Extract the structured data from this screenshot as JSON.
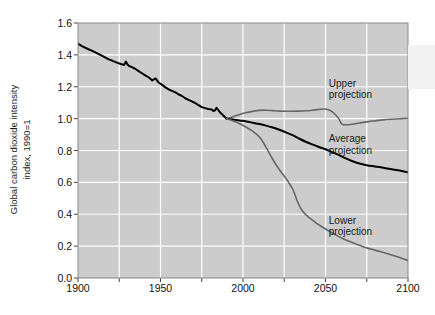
{
  "chart_data": {
    "type": "line",
    "title": "",
    "subtitle": "",
    "xlabel": "",
    "ylabel": "Global carbon dioxide intensity index, 1990=1",
    "ylabel_line1": "Global carbon dioxide intensity",
    "ylabel_line2": "index, 1990=1",
    "xlim": [
      1900,
      2100
    ],
    "ylim": [
      0.0,
      1.6
    ],
    "grid": true,
    "grid_color": "#ffffff",
    "plot_background": "#cccccc",
    "legend_position": "inline-annotations",
    "xticks": [
      1900,
      1950,
      2000,
      2050,
      2100
    ],
    "xtick_labels": [
      "1900",
      "1950",
      "2000",
      "2050",
      "2100"
    ],
    "xminor_ticks": [
      1925,
      1975,
      2025,
      2075
    ],
    "yticks": [
      0.0,
      0.2,
      0.4,
      0.6,
      0.8,
      1.0,
      1.2,
      1.4,
      1.6
    ],
    "ytick_labels": [
      "0.0",
      "0.2",
      "0.4",
      "0.6",
      "0.8",
      "1.0",
      "1.2",
      "1.4",
      "1.6"
    ],
    "annotations": [
      {
        "name": "upper-projection-label",
        "line1": "Upper",
        "line2": "projection",
        "x": 2052,
        "y": 1.22
      },
      {
        "name": "average-projection-label",
        "line1": "Average",
        "line2": "projection",
        "x": 2052,
        "y": 0.87
      },
      {
        "name": "lower-projection-label",
        "line1": "Lower",
        "line2": "projection",
        "x": 2052,
        "y": 0.36
      }
    ],
    "series": [
      {
        "name": "Historical",
        "color": "#000000",
        "width": 2.0,
        "x": [
          1900,
          1903,
          1906,
          1909,
          1912,
          1915,
          1918,
          1921,
          1924,
          1926,
          1928,
          1929,
          1930,
          1931,
          1933,
          1935,
          1937,
          1939,
          1941,
          1943,
          1945,
          1947,
          1949,
          1951,
          1953,
          1955,
          1957,
          1959,
          1961,
          1963,
          1965,
          1967,
          1969,
          1971,
          1973,
          1975,
          1977,
          1979,
          1981,
          1982,
          1983,
          1984,
          1985,
          1986,
          1987,
          1988,
          1989,
          1990
        ],
        "values": [
          1.47,
          1.452,
          1.437,
          1.423,
          1.408,
          1.392,
          1.375,
          1.362,
          1.35,
          1.343,
          1.337,
          1.358,
          1.34,
          1.33,
          1.322,
          1.31,
          1.296,
          1.283,
          1.27,
          1.258,
          1.24,
          1.252,
          1.225,
          1.212,
          1.196,
          1.183,
          1.174,
          1.165,
          1.152,
          1.142,
          1.128,
          1.118,
          1.108,
          1.098,
          1.085,
          1.072,
          1.066,
          1.06,
          1.058,
          1.048,
          1.052,
          1.068,
          1.054,
          1.04,
          1.03,
          1.02,
          1.01,
          1.0
        ]
      },
      {
        "name": "Upper projection",
        "color": "#666666",
        "width": 1.6,
        "x": [
          1990,
          1994,
          1998,
          2002,
          2006,
          2010,
          2014,
          2018,
          2022,
          2026,
          2030,
          2034,
          2038,
          2042,
          2046,
          2050,
          2054,
          2058,
          2060,
          2064,
          2068,
          2072,
          2076,
          2080,
          2085,
          2090,
          2095,
          2100
        ],
        "values": [
          1.0,
          1.012,
          1.026,
          1.038,
          1.046,
          1.052,
          1.053,
          1.05,
          1.047,
          1.046,
          1.046,
          1.047,
          1.049,
          1.053,
          1.058,
          1.06,
          1.044,
          1.0,
          0.965,
          0.962,
          0.968,
          0.975,
          0.981,
          0.986,
          0.992,
          0.996,
          0.999,
          1.002
        ]
      },
      {
        "name": "Average projection",
        "color": "#000000",
        "width": 2.0,
        "x": [
          1990,
          1994,
          1998,
          2002,
          2006,
          2010,
          2014,
          2018,
          2022,
          2026,
          2030,
          2034,
          2038,
          2042,
          2046,
          2050,
          2054,
          2058,
          2062,
          2066,
          2070,
          2075,
          2080,
          2085,
          2090,
          2095,
          2100
        ],
        "values": [
          1.0,
          0.994,
          0.988,
          0.982,
          0.974,
          0.966,
          0.956,
          0.944,
          0.93,
          0.914,
          0.896,
          0.875,
          0.855,
          0.838,
          0.822,
          0.808,
          0.79,
          0.772,
          0.752,
          0.734,
          0.72,
          0.708,
          0.7,
          0.692,
          0.683,
          0.674,
          0.664
        ]
      },
      {
        "name": "Lower projection",
        "color": "#666666",
        "width": 1.6,
        "x": [
          1990,
          1994,
          1998,
          2002,
          2006,
          2010,
          2014,
          2018,
          2022,
          2026,
          2030,
          2033,
          2036,
          2040,
          2044,
          2048,
          2052,
          2056,
          2060,
          2064,
          2068,
          2072,
          2076,
          2080,
          2085,
          2090,
          2095,
          2100
        ],
        "values": [
          1.0,
          0.985,
          0.968,
          0.946,
          0.92,
          0.884,
          0.82,
          0.745,
          0.68,
          0.625,
          0.56,
          0.48,
          0.42,
          0.38,
          0.348,
          0.32,
          0.295,
          0.272,
          0.25,
          0.232,
          0.215,
          0.2,
          0.186,
          0.175,
          0.16,
          0.145,
          0.128,
          0.11
        ]
      }
    ]
  }
}
